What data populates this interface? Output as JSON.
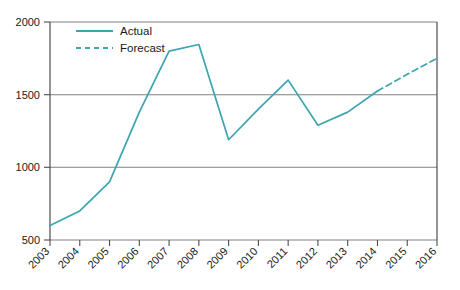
{
  "chart_data": {
    "type": "line",
    "title": "",
    "xlabel": "",
    "ylabel": "",
    "grid": true,
    "legend_position": "top-left",
    "categories": [
      "2003",
      "2004",
      "2005",
      "2006",
      "2007",
      "2008",
      "2009",
      "2010",
      "2011",
      "2012",
      "2013",
      "2014",
      "2015",
      "2016"
    ],
    "x": [
      2003,
      2004,
      2005,
      2006,
      2007,
      2008,
      2009,
      2010,
      2011,
      2012,
      2013,
      2014,
      2015,
      2016
    ],
    "xlim": [
      2003,
      2016
    ],
    "ylim": [
      500,
      2000
    ],
    "yticks": [
      500,
      1000,
      1500,
      2000
    ],
    "ytick_labels": [
      "500",
      "1000",
      "1500",
      "2000"
    ],
    "series": [
      {
        "name": "Actual",
        "style": "solid",
        "color": "#3BA5B0",
        "x": [
          2003,
          2004,
          2005,
          2006,
          2007,
          2008,
          2009,
          2010,
          2011,
          2012,
          2013,
          2014
        ],
        "values": [
          600,
          700,
          900,
          1380,
          1800,
          1845,
          1190,
          1400,
          1600,
          1290,
          1380,
          1525
        ]
      },
      {
        "name": "Forecast",
        "style": "dashed",
        "color": "#3BA5B0",
        "x": [
          2014,
          2015,
          2016
        ],
        "values": [
          1525,
          1640,
          1750
        ]
      }
    ]
  },
  "legend": {
    "items": [
      {
        "label": "Actual",
        "style": "solid"
      },
      {
        "label": "Forecast",
        "style": "dashed"
      }
    ]
  },
  "axes": {
    "y_tick_labels": [
      "2000",
      "1500",
      "1000",
      "500"
    ],
    "x_tick_labels": [
      "2003",
      "2004",
      "2005",
      "2006",
      "2007",
      "2008",
      "2009",
      "2010",
      "2011",
      "2012",
      "2013",
      "2014",
      "2015",
      "2016"
    ]
  },
  "colors": {
    "line": "#3BA5B0",
    "grid": "#808080",
    "axis": "#4d4d4d",
    "text": "#1a1a1a",
    "background": "#ffffff"
  }
}
